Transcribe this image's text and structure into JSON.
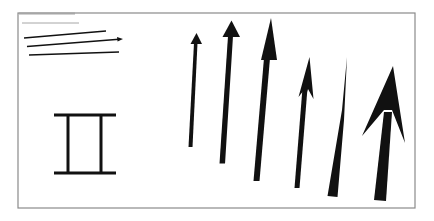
{
  "diagram": {
    "title": "",
    "colors": {
      "frame": "#8a8a8a",
      "header_line": "#a6a6a6",
      "ink": "#111111",
      "background": "#ffffff"
    },
    "elements": [
      {
        "id": "header-line-thick",
        "kind": "gray-line"
      },
      {
        "id": "header-line-thin",
        "kind": "gray-line"
      },
      {
        "id": "thin-line-1",
        "kind": "thin-line"
      },
      {
        "id": "thin-arrow",
        "kind": "thin-arrow"
      },
      {
        "id": "thin-line-3",
        "kind": "thin-line"
      },
      {
        "id": "i-beam",
        "kind": "i-beam-symbol"
      },
      {
        "id": "arrow-1",
        "kind": "arrow",
        "style": "thin-shaft-small-head"
      },
      {
        "id": "arrow-2",
        "kind": "arrow",
        "style": "medium-shaft-small-head"
      },
      {
        "id": "arrow-3",
        "kind": "arrow",
        "style": "medium-shaft-long-head"
      },
      {
        "id": "arrow-4",
        "kind": "arrow",
        "style": "barbed-head"
      },
      {
        "id": "arrow-5",
        "kind": "arrow",
        "style": "tapered-needle"
      },
      {
        "id": "arrow-6",
        "kind": "arrow",
        "style": "large-barbed-head"
      }
    ]
  }
}
